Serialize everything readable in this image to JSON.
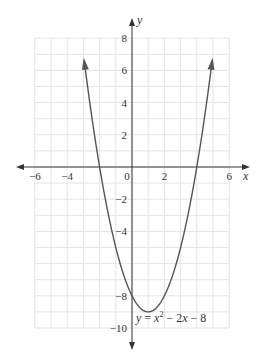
{
  "chart_data": {
    "type": "line",
    "title": "",
    "xlabel": "x",
    "ylabel": "y",
    "xlim": [
      -6,
      6
    ],
    "ylim": [
      -10,
      8
    ],
    "grid": true,
    "x_ticks": [
      -6,
      -4,
      2,
      6
    ],
    "x_tick_labels": [
      "−6",
      "−4",
      "2",
      "6"
    ],
    "origin_label": "0",
    "y_ticks": [
      8,
      6,
      4,
      2,
      -2,
      -4,
      -8,
      -10
    ],
    "y_tick_labels": [
      "8",
      "6",
      "4",
      "2",
      "−2",
      "−4",
      "−8",
      "−10"
    ],
    "series": [
      {
        "name": "y = x^2 - 2x - 8",
        "function": "x^2 - 2x - 8",
        "x": [
          -3,
          -2,
          -1,
          0,
          1,
          2,
          3,
          4,
          5
        ],
        "y": [
          7,
          0,
          -5,
          -8,
          -9,
          -8,
          -5,
          0,
          7
        ],
        "color": "#555555",
        "arrows_at_ends": true
      }
    ],
    "annotations": [
      {
        "text": "y = x² − 2x − 8",
        "near": [
          1.5,
          -9.5
        ]
      }
    ],
    "key_points": {
      "vertex": [
        1,
        -9
      ],
      "x_intercepts": [
        [
          -2,
          0
        ],
        [
          4,
          0
        ]
      ],
      "y_intercept": [
        0,
        -8
      ]
    }
  },
  "equation": {
    "y": "y",
    "eq": " = ",
    "x": "x",
    "exp": "2",
    "rest_minus": " − 2",
    "x2": "x",
    "rest_end": " − 8"
  },
  "colors": {
    "axis": "#333333",
    "curve": "#555555",
    "grid": "#e4e4e4",
    "background": "#ffffff"
  }
}
